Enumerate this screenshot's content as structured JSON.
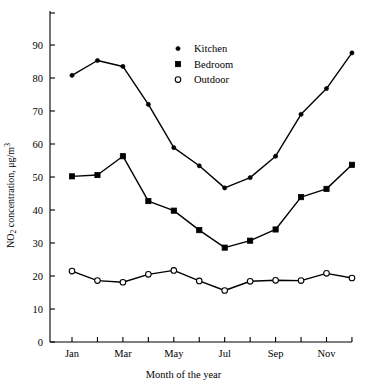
{
  "chart_data": {
    "type": "line",
    "title": "",
    "xlabel": "Month of the year",
    "ylabel": "NO2 concentration, μg/m3",
    "ylabel_parts": {
      "prefix": "NO",
      "sub": "2",
      "mid": " concentration, μg/m",
      "sup": "3"
    },
    "categories": [
      "Jan",
      "Feb",
      "Mar",
      "Apr",
      "May",
      "Jun",
      "Jul",
      "Aug",
      "Sep",
      "Oct",
      "Nov",
      "Dec"
    ],
    "x_tick_labels": [
      "Jan",
      "",
      "Mar",
      "",
      "May",
      "",
      "Jul",
      "",
      "Sep",
      "",
      "Nov",
      ""
    ],
    "y_ticks": [
      0,
      10,
      20,
      30,
      40,
      50,
      60,
      70,
      80,
      90
    ],
    "ylim": [
      0,
      97
    ],
    "xlim": [
      0.3,
      12.7
    ],
    "grid": false,
    "legend_position": "upper-center",
    "series": [
      {
        "name": "Kitchen",
        "marker": "small-filled-circle",
        "color": "#000000",
        "values": [
          80.8,
          85.3,
          83.5,
          72.0,
          58.9,
          53.4,
          46.7,
          49.8,
          56.3,
          69.0,
          76.8,
          87.6
        ]
      },
      {
        "name": "Bedroom",
        "marker": "filled-square",
        "color": "#000000",
        "values": [
          50.2,
          50.6,
          56.3,
          42.7,
          39.8,
          33.9,
          28.6,
          30.7,
          34.1,
          43.9,
          46.4,
          53.7
        ]
      },
      {
        "name": "Outdoor",
        "marker": "open-circle",
        "color": "#000000",
        "values": [
          21.5,
          18.6,
          18.1,
          20.5,
          21.7,
          18.5,
          15.6,
          18.4,
          18.7,
          18.6,
          20.8,
          19.4
        ]
      }
    ]
  },
  "legend": {
    "items": [
      {
        "label": "Kitchen",
        "marker": "small-filled-circle"
      },
      {
        "label": "Bedroom",
        "marker": "filled-square"
      },
      {
        "label": "Outdoor",
        "marker": "open-circle"
      }
    ]
  },
  "axes": {
    "x_title": "Month of the year",
    "y_title": "NO2 concentration, μg/m3"
  }
}
